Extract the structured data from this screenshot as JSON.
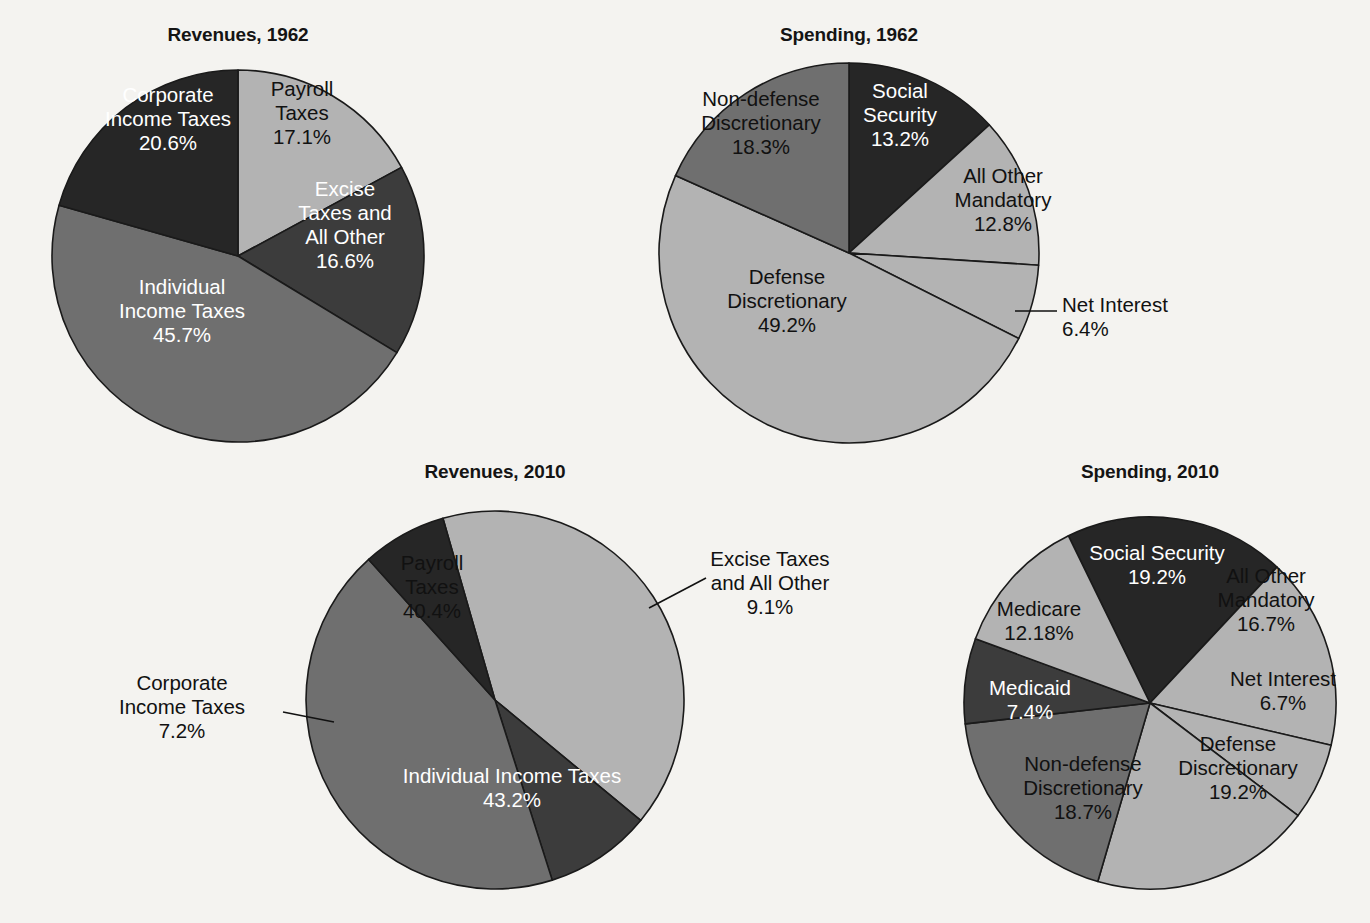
{
  "page": {
    "background_color": "#f4f3f0",
    "title_color": "#141414"
  },
  "palette": {
    "near_black": "#262626",
    "dark_gray": "#3c3c3c",
    "medium_gray": "#6f6f6f",
    "light_gray": "#b3b3b3",
    "outline": "#1a1a1a",
    "label_light": "#ffffff",
    "label_dark": "#111111"
  },
  "charts": [
    {
      "id": "revenues-1962",
      "title": "Revenues, 1962",
      "title_x": 238,
      "title_y": 24,
      "cx": 238,
      "cy": 256,
      "r": 186,
      "start_angle": 0,
      "chart_data": {
        "type": "pie",
        "title": "Revenues, 1962",
        "units": "percent of total",
        "categories": [
          "Payroll Taxes",
          "Excise Taxes and All Other",
          "Individual Income Taxes",
          "Corporate Income Taxes"
        ],
        "values": [
          17.1,
          16.6,
          45.7,
          20.6
        ],
        "legend": "none (labels inside slices)"
      },
      "slices": [
        {
          "name": "Payroll Taxes",
          "value": 17.1,
          "value_label": "17.1%",
          "color": "#b3b3b3",
          "label_color": "dark",
          "label_lines": [
            "Payroll",
            "Taxes",
            "17.1%"
          ],
          "label_x": 302,
          "label_y": 120,
          "placement": "inside"
        },
        {
          "name": "Excise Taxes and All Other",
          "value": 16.6,
          "value_label": "16.6%",
          "color": "#3c3c3c",
          "label_color": "light",
          "label_lines": [
            "Excise",
            "Taxes and",
            "All Other",
            "16.6%"
          ],
          "label_x": 345,
          "label_y": 232,
          "placement": "inside"
        },
        {
          "name": "Individual Income Taxes",
          "value": 45.7,
          "value_label": "45.7%",
          "color": "#6f6f6f",
          "label_color": "light",
          "label_lines": [
            "Individual",
            "Income Taxes",
            "45.7%"
          ],
          "label_x": 182,
          "label_y": 318,
          "placement": "inside"
        },
        {
          "name": "Corporate Income Taxes",
          "value": 20.6,
          "value_label": "20.6%",
          "color": "#262626",
          "label_color": "light",
          "label_lines": [
            "Corporate",
            "Income Taxes",
            "20.6%"
          ],
          "label_x": 168,
          "label_y": 126,
          "placement": "inside"
        }
      ],
      "callouts": []
    },
    {
      "id": "spending-1962",
      "title": "Spending, 1962",
      "title_x": 849,
      "title_y": 24,
      "cx": 849,
      "cy": 253,
      "r": 190,
      "start_angle": 0,
      "chart_data": {
        "type": "pie",
        "title": "Spending, 1962",
        "units": "percent of total",
        "categories": [
          "Social Security",
          "All Other Mandatory",
          "Net Interest",
          "Defense Discretionary",
          "Non-defense Discretionary"
        ],
        "values": [
          13.2,
          12.8,
          6.4,
          49.2,
          18.3
        ],
        "legend": "none (labels inside slices plus one leader callout)"
      },
      "slices": [
        {
          "name": "Social Security",
          "value": 13.2,
          "value_label": "13.2%",
          "color": "#262626",
          "label_color": "light",
          "label_lines": [
            "Social",
            "Security",
            "13.2%"
          ],
          "label_x": 900,
          "label_y": 122,
          "placement": "inside"
        },
        {
          "name": "All Other Mandatory",
          "value": 12.8,
          "value_label": "12.8%",
          "color": "#b3b3b3",
          "label_color": "dark",
          "label_lines": [
            "All Other",
            "Mandatory",
            "12.8%"
          ],
          "label_x": 1003,
          "label_y": 207,
          "placement": "inside"
        },
        {
          "name": "Net Interest",
          "value": 6.4,
          "value_label": "6.4%",
          "color": "#b3b3b3",
          "label_color": "dark",
          "label_lines": [
            "Net Interest",
            "6.4%"
          ],
          "label_x": 1110,
          "label_y": 312,
          "placement": "callout"
        },
        {
          "name": "Defense Discretionary",
          "value": 49.2,
          "value_label": "49.2%",
          "color": "#b3b3b3",
          "label_color": "dark",
          "label_lines": [
            "Defense",
            "Discretionary",
            "49.2%"
          ],
          "label_x": 787,
          "label_y": 308,
          "placement": "inside"
        },
        {
          "name": "Non-defense Discretionary",
          "value": 18.3,
          "value_label": "18.3%",
          "color": "#6f6f6f",
          "label_color": "dark",
          "label_lines": [
            "Non-defense",
            "Discretionary",
            "18.3%"
          ],
          "label_x": 761,
          "label_y": 130,
          "placement": "inside"
        }
      ],
      "callouts": [
        {
          "for": "Net Interest",
          "line": "M 1015,311 L 1057,311",
          "text_x": 1062,
          "text_y": 312,
          "anchor": "start",
          "lines": [
            "Net Interest",
            "6.4%"
          ],
          "line2_x": 1110,
          "line2_anchor": "middle"
        }
      ]
    },
    {
      "id": "revenues-2010",
      "title": "Revenues, 2010",
      "title_x": 495,
      "title_y": 461,
      "cx": 495,
      "cy": 700,
      "r": 189,
      "start_angle": -16,
      "chart_data": {
        "type": "pie",
        "title": "Revenues, 2010",
        "units": "percent of total",
        "categories": [
          "Payroll Taxes",
          "Excise Taxes and All Other",
          "Individual Income Taxes",
          "Corporate Income Taxes"
        ],
        "values": [
          40.4,
          9.1,
          43.2,
          7.2
        ],
        "legend": "none (labels inside slices plus two leader callouts)"
      },
      "slices": [
        {
          "name": "Payroll Taxes",
          "value": 40.4,
          "value_label": "40.4%",
          "color": "#b3b3b3",
          "label_color": "dark",
          "label_lines": [
            "Payroll",
            "Taxes",
            "40.4%"
          ],
          "label_x": 432,
          "label_y": 594,
          "placement": "inside"
        },
        {
          "name": "Excise Taxes and All Other",
          "value": 9.1,
          "value_label": "9.1%",
          "color": "#3c3c3c",
          "label_color": "dark",
          "label_lines": [
            "Excise Taxes",
            "and All Other",
            "9.1%"
          ],
          "label_x": 770,
          "label_y": 578,
          "placement": "callout"
        },
        {
          "name": "Individual Income Taxes",
          "value": 43.2,
          "value_label": "43.2%",
          "color": "#6f6f6f",
          "label_color": "light",
          "label_lines": [
            "Individual Income Taxes",
            "43.2%"
          ],
          "label_x": 512,
          "label_y": 795,
          "placement": "inside"
        },
        {
          "name": "Corporate Income Taxes",
          "value": 7.2,
          "value_label": "7.2%",
          "color": "#262626",
          "label_color": "dark",
          "label_lines": [
            "Corporate",
            "Income Taxes",
            "7.2%"
          ],
          "label_x": 182,
          "label_y": 712,
          "placement": "callout"
        }
      ],
      "callouts": [
        {
          "for": "Excise Taxes and All Other",
          "line": "M 649,608 L 706,578",
          "text_x": 770,
          "text_y": 566,
          "anchor": "middle",
          "lines": [
            "Excise Taxes",
            "and All Other",
            "9.1%"
          ]
        },
        {
          "for": "Corporate Income Taxes",
          "line": "M 334,722 L 283,712",
          "text_x": 182,
          "text_y": 690,
          "anchor": "middle",
          "lines": [
            "Corporate",
            "Income Taxes",
            "7.2%"
          ]
        }
      ]
    },
    {
      "id": "spending-2010",
      "title": "Spending, 2010",
      "title_x": 1150,
      "title_y": 461,
      "cx": 1150,
      "cy": 703,
      "r": 186,
      "start_angle": -26,
      "chart_data": {
        "type": "pie",
        "title": "Spending, 2010",
        "units": "percent of total",
        "categories": [
          "Social Security",
          "All Other Mandatory",
          "Net Interest",
          "Defense Discretionary",
          "Non-defense Discretionary",
          "Medicaid",
          "Medicare"
        ],
        "values": [
          19.2,
          16.7,
          6.7,
          19.2,
          18.7,
          7.4,
          12.18
        ],
        "legend": "none (labels inside slices)"
      },
      "slices": [
        {
          "name": "Social Security",
          "value": 19.2,
          "value_label": "19.2%",
          "color": "#262626",
          "label_color": "light",
          "label_lines": [
            "Social Security",
            "19.2%"
          ],
          "label_x": 1157,
          "label_y": 572,
          "placement": "inside"
        },
        {
          "name": "All Other Mandatory",
          "value": 16.7,
          "value_label": "16.7%",
          "color": "#b3b3b3",
          "label_color": "dark",
          "label_lines": [
            "All Other",
            "Mandatory",
            "16.7%"
          ],
          "label_x": 1266,
          "label_y": 607,
          "placement": "inside"
        },
        {
          "name": "Net Interest",
          "value": 6.7,
          "value_label": "6.7%",
          "color": "#b3b3b3",
          "label_color": "dark",
          "label_lines": [
            "Net Interest",
            "6.7%"
          ],
          "label_x": 1283,
          "label_y": 698,
          "placement": "inside"
        },
        {
          "name": "Defense Discretionary",
          "value": 19.2,
          "value_label": "19.2%",
          "color": "#b3b3b3",
          "label_color": "dark",
          "label_lines": [
            "Defense",
            "Discretionary",
            "19.2%"
          ],
          "label_x": 1238,
          "label_y": 775,
          "placement": "inside"
        },
        {
          "name": "Non-defense Discretionary",
          "value": 18.7,
          "value_label": "18.7%",
          "color": "#6f6f6f",
          "label_color": "dark",
          "label_lines": [
            "Non-defense",
            "Discretionary",
            "18.7%"
          ],
          "label_x": 1083,
          "label_y": 795,
          "placement": "inside"
        },
        {
          "name": "Medicaid",
          "value": 7.4,
          "value_label": "7.4%",
          "color": "#3c3c3c",
          "label_color": "light",
          "label_lines": [
            "Medicaid",
            "7.4%"
          ],
          "label_x": 1030,
          "label_y": 707,
          "placement": "inside"
        },
        {
          "name": "Medicare",
          "value": 12.18,
          "value_label": "12.18%",
          "color": "#b3b3b3",
          "label_color": "dark",
          "label_lines": [
            "Medicare",
            "12.18%"
          ],
          "label_x": 1039,
          "label_y": 628,
          "placement": "inside"
        }
      ],
      "callouts": []
    }
  ]
}
